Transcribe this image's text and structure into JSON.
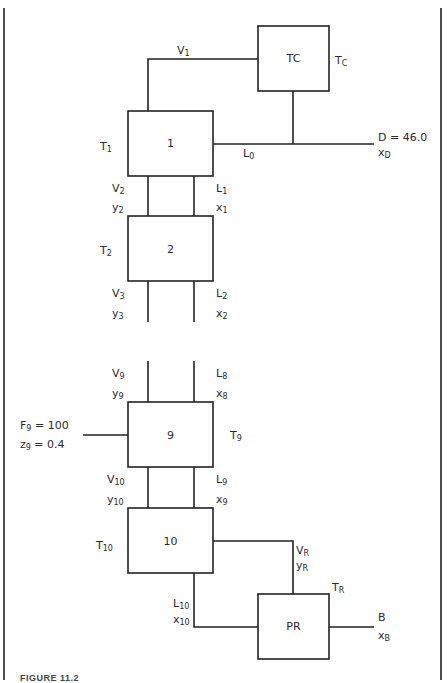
{
  "figure": {
    "caption": "FIGURE 11.2",
    "units": [
      {
        "id": "TC",
        "label": "TC",
        "temp": {
          "base": "T",
          "sub": "C"
        }
      },
      {
        "id": "1",
        "label": "1",
        "temp": {
          "base": "T",
          "sub": "1"
        }
      },
      {
        "id": "2",
        "label": "2",
        "temp": {
          "base": "T",
          "sub": "2"
        }
      },
      {
        "id": "9",
        "label": "9",
        "temp": {
          "base": "T",
          "sub": "9"
        }
      },
      {
        "id": "10",
        "label": "10",
        "temp": {
          "base": "T",
          "sub": "10"
        }
      },
      {
        "id": "PR",
        "label": "PR",
        "temp": {
          "base": "T",
          "sub": "R"
        }
      }
    ],
    "streams": {
      "V1": {
        "base": "V",
        "sub": "1"
      },
      "L0": {
        "base": "L",
        "sub": "0"
      },
      "D": {
        "text": "D = 46.0",
        "comp_base": "x",
        "comp_sub": "D"
      },
      "V2": {
        "base": "V",
        "sub": "2"
      },
      "y2": {
        "base": "y",
        "sub": "2"
      },
      "L1": {
        "base": "L",
        "sub": "1"
      },
      "x1": {
        "base": "x",
        "sub": "1"
      },
      "V3": {
        "base": "V",
        "sub": "3"
      },
      "y3": {
        "base": "y",
        "sub": "3"
      },
      "L2": {
        "base": "L",
        "sub": "2"
      },
      "x2": {
        "base": "x",
        "sub": "2"
      },
      "V9": {
        "base": "V",
        "sub": "9"
      },
      "y9": {
        "base": "y",
        "sub": "9"
      },
      "L8": {
        "base": "L",
        "sub": "8"
      },
      "x8": {
        "base": "x",
        "sub": "8"
      },
      "F9": {
        "base": "F",
        "sub": "9",
        "value": " = 100"
      },
      "z9": {
        "base": "z",
        "sub": "9",
        "value": " = 0.4"
      },
      "V10": {
        "base": "V",
        "sub": "10"
      },
      "y10": {
        "base": "y",
        "sub": "10"
      },
      "L9": {
        "base": "L",
        "sub": "9"
      },
      "x9": {
        "base": "x",
        "sub": "9"
      },
      "VR": {
        "base": "V",
        "sub": "R"
      },
      "yR": {
        "base": "y",
        "sub": "R"
      },
      "L10": {
        "base": "L",
        "sub": "10"
      },
      "x10": {
        "base": "x",
        "sub": "10"
      },
      "B": {
        "text": "B",
        "comp_base": "x",
        "comp_sub": "B"
      }
    }
  }
}
